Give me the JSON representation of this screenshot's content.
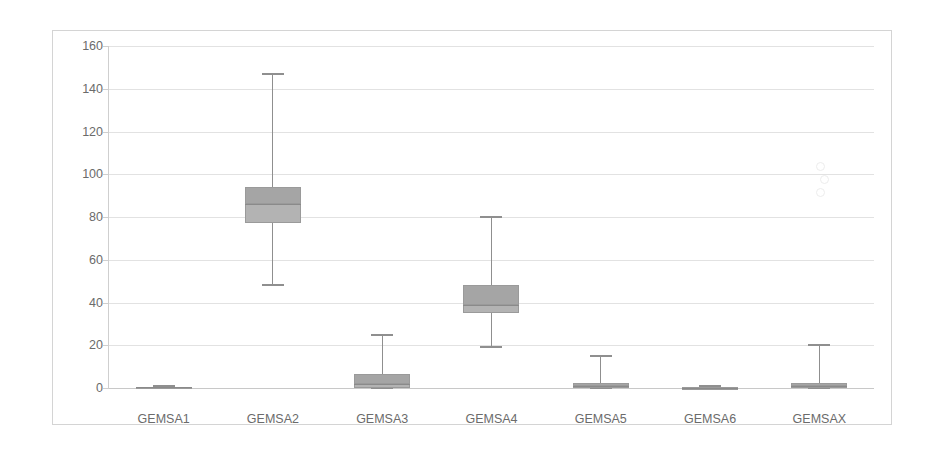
{
  "chart_data": {
    "type": "box",
    "title": "",
    "xlabel": "",
    "ylabel": "",
    "ylim": [
      0,
      160
    ],
    "yticks": [
      0,
      20,
      40,
      60,
      80,
      100,
      120,
      140,
      160
    ],
    "grid": true,
    "legend": "none",
    "categories": [
      "GEMSA1",
      "GEMSA2",
      "GEMSA3",
      "GEMSA4",
      "GEMSA5",
      "GEMSA6",
      "GEMSAX"
    ],
    "boxes": [
      {
        "category": "GEMSA1",
        "min": 0,
        "q1": 0,
        "median": 0.3,
        "q3": 0.6,
        "max": 1.0,
        "outliers": []
      },
      {
        "category": "GEMSA2",
        "min": 48,
        "q1": 77,
        "median": 86,
        "q3": 94,
        "max": 147,
        "outliers": []
      },
      {
        "category": "GEMSA3",
        "min": 0,
        "q1": 0,
        "median": 2,
        "q3": 6.5,
        "max": 25,
        "outliers": []
      },
      {
        "category": "GEMSA4",
        "min": 19,
        "q1": 35,
        "median": 39,
        "q3": 48,
        "max": 80,
        "outliers": []
      },
      {
        "category": "GEMSA5",
        "min": 0,
        "q1": 0,
        "median": 1,
        "q3": 2.5,
        "max": 15,
        "outliers": []
      },
      {
        "category": "GEMSA6",
        "min": 0,
        "q1": 0,
        "median": 0.2,
        "q3": 0.5,
        "max": 0.8,
        "outliers": []
      },
      {
        "category": "GEMSAX",
        "min": 0,
        "q1": 0,
        "median": 1,
        "q3": 2.5,
        "max": 20,
        "outliers": [
          92,
          98,
          104
        ]
      }
    ],
    "colors": {
      "box_fill": "#b3b3b3",
      "box_fill_upper": "#a5a5a5",
      "box_border": "#9a9a9a",
      "whisker": "#8f8f8f",
      "gridline": "#e2e2e2",
      "axis": "#cfcfcf",
      "tick_text": "#6b6b6b",
      "frame": "#d4d4d4",
      "background": "#ffffff"
    }
  }
}
